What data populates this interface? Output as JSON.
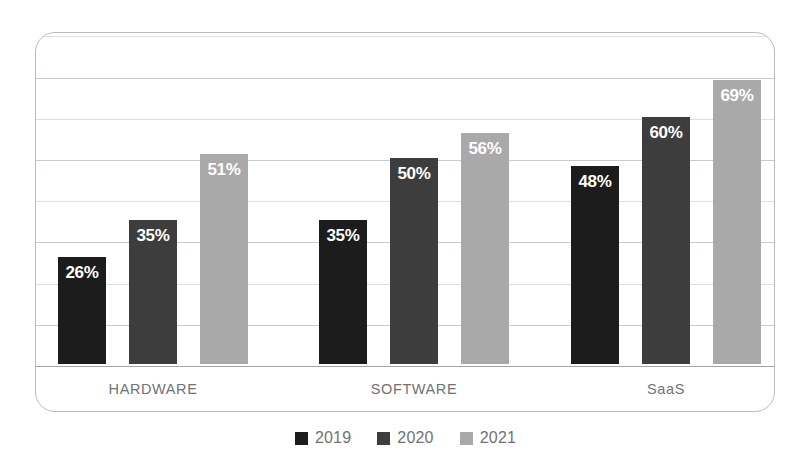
{
  "chart_data": {
    "type": "bar",
    "title": "",
    "subtitle": "",
    "xlabel": "",
    "ylabel": "",
    "categories": [
      "HARDWARE",
      "SOFTWARE",
      "SaaS"
    ],
    "series": [
      {
        "name": "2019",
        "color": "#1c1c1c",
        "values": [
          26,
          35,
          48
        ]
      },
      {
        "name": "2020",
        "color": "#3d3d3d",
        "values": [
          35,
          50,
          60
        ]
      },
      {
        "name": "2021",
        "color": "#a9a9a9",
        "values": [
          51,
          56,
          69
        ]
      }
    ],
    "bars": [
      {
        "group": "HARDWARE",
        "series": "2019",
        "value": 26,
        "label": "26%",
        "color": "#1c1c1c"
      },
      {
        "group": "HARDWARE",
        "series": "2020",
        "value": 35,
        "label": "35%",
        "color": "#3d3d3d"
      },
      {
        "group": "HARDWARE",
        "series": "2021",
        "value": 51,
        "label": "51%",
        "color": "#a9a9a9"
      },
      {
        "group": "SOFTWARE",
        "series": "2019",
        "value": 48,
        "label": "48%",
        "color": "#1c1c1c"
      },
      {
        "group": "SOFTWARE",
        "series": "2020",
        "value": 50,
        "label": "50%",
        "color": "#3d3d3d"
      },
      {
        "group": "SOFTWARE",
        "series": "2021",
        "value": 56,
        "label": "56%",
        "color": "#a9a9a9"
      },
      {
        "group": "SaaS",
        "series": "2019",
        "value": 40,
        "label": "40%",
        "color": "#1c1c1c"
      },
      {
        "group": "SaaS",
        "series": "2020",
        "value": 60,
        "label": "60%",
        "color": "#3d3d3d"
      },
      {
        "group": "SaaS",
        "series": "2021",
        "value": 69,
        "label": "69%",
        "color": "#a9a9a9"
      }
    ],
    "ylim": [
      0,
      80
    ],
    "gridline_values": [
      10,
      20,
      30,
      40,
      50,
      60,
      70,
      80
    ],
    "grid": true,
    "legend": {
      "position": "bottom-center",
      "entries": [
        {
          "label": "2019",
          "color": "#1c1c1c"
        },
        {
          "label": "2020",
          "color": "#3d3d3d"
        },
        {
          "label": "2021",
          "color": "#a9a9a9"
        }
      ]
    },
    "value_label_suffix": "%"
  },
  "frame": {
    "border_color": "#b9bcbe",
    "grid_color": "#c9cccd",
    "baseline_color": "#9fa3a5",
    "background": "#ffffff",
    "category_label_color": "#6f7376"
  }
}
